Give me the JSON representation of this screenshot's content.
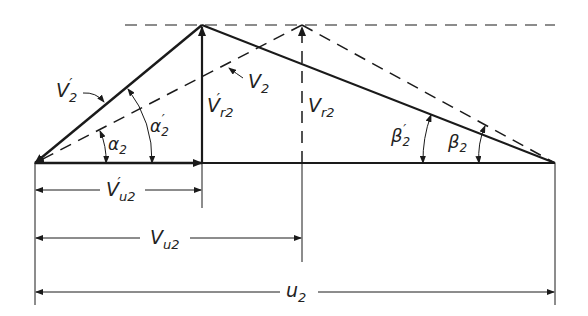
{
  "diagram": {
    "type": "velocity-triangle",
    "labels": {
      "v2_prime": "V",
      "v2_prime_sub": "2",
      "v2": "V",
      "v2_sub": "2",
      "vr2_prime": "V",
      "vr2_prime_sub": "r2",
      "vr2": "V",
      "vr2_sub": "r2",
      "alpha2": "α",
      "alpha2_sub": "2",
      "alpha2_prime": "α",
      "alpha2_prime_sub": "2",
      "beta2_prime": "β",
      "beta2_prime_sub": "2",
      "beta2": "β",
      "beta2_sub": "2",
      "vu2_prime": "V",
      "vu2_prime_sub": "u2",
      "vu2": "V",
      "vu2_sub": "u2",
      "u2": "u",
      "u2_sub": "2",
      "prime": "′"
    },
    "colors": {
      "stroke": "#1a1a1a",
      "background": "#ffffff"
    }
  }
}
